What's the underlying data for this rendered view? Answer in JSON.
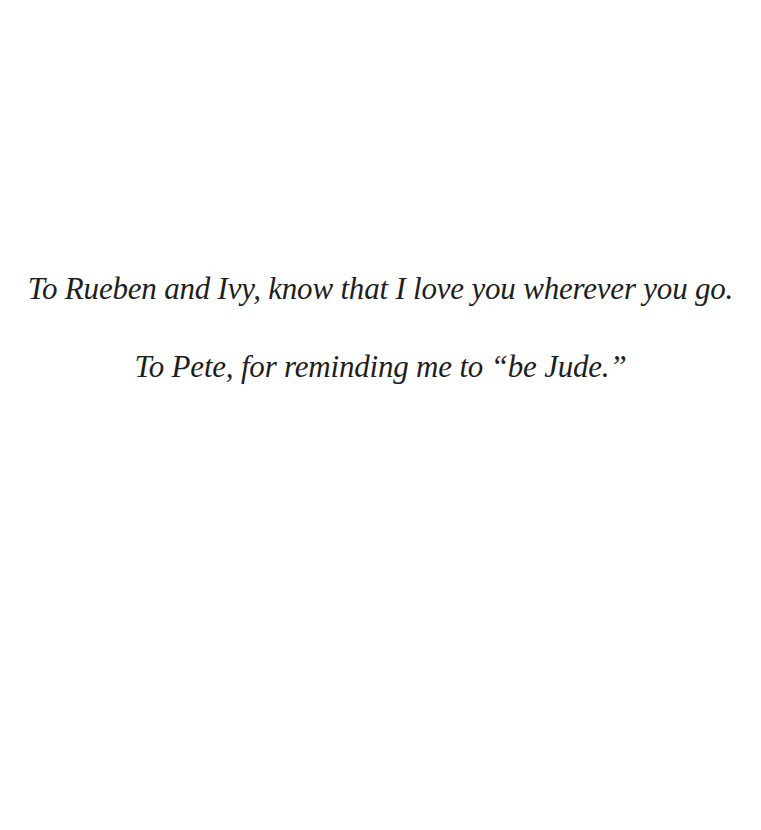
{
  "page": {
    "type": "dedication",
    "background_color": "#ffffff",
    "text_color": "#1e1e1e"
  },
  "dedication": {
    "lines": [
      "To Rueben and Ivy, know that I love you wherever you go.",
      "To Pete, for reminding me to “be Jude.”"
    ]
  }
}
